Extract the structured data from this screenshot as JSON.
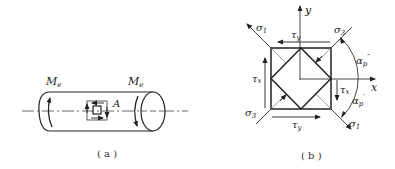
{
  "panel_a": {
    "caption": "( a )",
    "moment_left": "M",
    "moment_left_sub": "e",
    "moment_right": "M",
    "moment_right_sub": "e",
    "point_label": "A"
  },
  "panel_b": {
    "caption": "( b )",
    "axis_x": "x",
    "axis_y": "y",
    "sigma1_top": "σ",
    "sigma1_top_sub": "1",
    "sigma3_top": "σ",
    "sigma3_top_sub": "3",
    "sigma3_bottom": "σ",
    "sigma3_bottom_sub": "3",
    "sigma1_bottom": "σ",
    "sigma1_bottom_sub": "1",
    "tau_y_top": "τ",
    "tau_y_top_sub": "y",
    "tau_y_bottom": "τ",
    "tau_y_bottom_sub": "y",
    "tau_x_left": "τ",
    "tau_x_left_sub": "x",
    "tau_x_right": "τ",
    "tau_x_right_sub": "x",
    "alpha_upper": "α",
    "alpha_upper_sub": "p",
    "alpha_upper_sup": "″",
    "alpha_lower": "α",
    "alpha_lower_sub": "p",
    "alpha_lower_sup": "′"
  }
}
